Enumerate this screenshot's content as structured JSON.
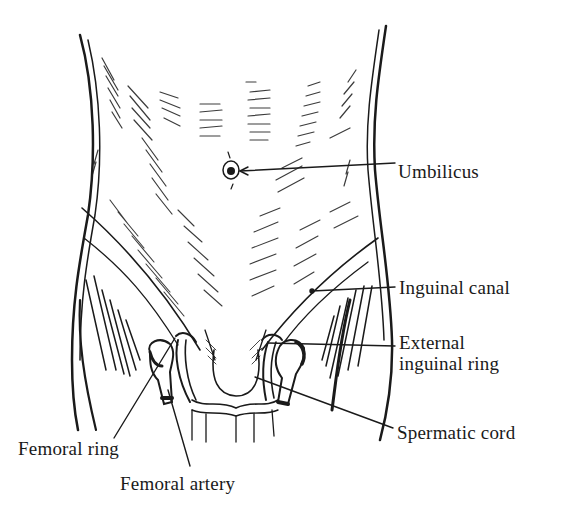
{
  "figure": {
    "type": "anatomical line drawing",
    "colors": {
      "ink": "#1a1a1a",
      "background": "#ffffff"
    }
  },
  "labels": [
    {
      "id": "umbilicus",
      "text": "Umbilicus",
      "x": 398,
      "y": 172
    },
    {
      "id": "inguinal-canal",
      "text": "Inguinal canal",
      "x": 399,
      "y": 279
    },
    {
      "id": "external-inguinal-ring-1",
      "text": "External",
      "x": 399,
      "y": 338
    },
    {
      "id": "external-inguinal-ring-2",
      "text": "inguinal ring",
      "x": 399,
      "y": 361
    },
    {
      "id": "spermatic-cord",
      "text": "Spermatic cord",
      "x": 397,
      "y": 424
    },
    {
      "id": "femoral-ring",
      "text": "Femoral ring",
      "x": 18,
      "y": 438
    },
    {
      "id": "femoral-artery",
      "text": "Femoral artery",
      "x": 120,
      "y": 475
    }
  ]
}
